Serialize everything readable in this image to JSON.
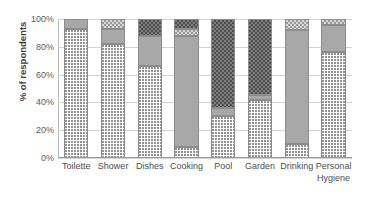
{
  "chart_data": {
    "type": "bar",
    "subtype": "stacked-bar-100-percent",
    "title": "",
    "xlabel": "",
    "ylabel": "% of respondents",
    "ylim": [
      0,
      100
    ],
    "ytick_labels": [
      "100%",
      "80%",
      "60%",
      "40%",
      "20%",
      "0%"
    ],
    "ytick_values": [
      100,
      80,
      60,
      40,
      20,
      0
    ],
    "grid": true,
    "legend": "none",
    "categories": [
      "Toilette",
      "Shower",
      "Dishes",
      "Cooking",
      "Pool",
      "Garden",
      "Drinking",
      "Personal Hygiene"
    ],
    "category_lines": [
      [
        "Toilette"
      ],
      [
        "Shower"
      ],
      [
        "Dishes"
      ],
      [
        "Cooking"
      ],
      [
        "Pool"
      ],
      [
        "Garden"
      ],
      [
        "Drinking"
      ],
      [
        "Personal",
        "Hygiene"
      ]
    ],
    "series": [
      {
        "name": "dotted",
        "pattern": "dotted",
        "values": [
          93,
          82,
          66,
          8,
          30,
          42,
          10,
          76
        ]
      },
      {
        "name": "solid-gray",
        "pattern": "solid-gray",
        "values": [
          7,
          11,
          22,
          80,
          6,
          3,
          82,
          20
        ]
      },
      {
        "name": "light-checkered",
        "pattern": "light-checkered",
        "values": [
          0,
          7,
          0,
          5,
          0,
          0,
          8,
          4
        ]
      },
      {
        "name": "dark-hatched",
        "pattern": "dark-hatched",
        "values": [
          0,
          0,
          12,
          7,
          64,
          55,
          0,
          0
        ]
      }
    ],
    "colors": {
      "dotted": "#ffffff",
      "solid-gray": "#a8a8a8",
      "light-checkered": "#d8d8d8",
      "dark-hatched": "#7d7d7d",
      "gridline": "#d2d2d2",
      "axis": "#9a9a9a",
      "text": "#4d4d4d"
    }
  }
}
